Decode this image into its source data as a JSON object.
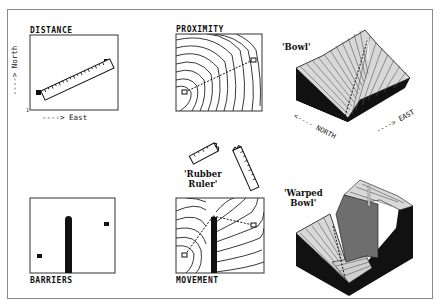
{
  "figure": {
    "panels": {
      "distance": {
        "title": "DISTANCE",
        "x_axis_label": "----> East",
        "y_axis_label": "----> North",
        "origin_tick": "1"
      },
      "proximity": {
        "title": "PROXIMITY"
      },
      "bowl": {
        "label": "'Bowl'",
        "north_label": "<---- NORTH",
        "east_label": "----> EAST"
      },
      "rubber_ruler": {
        "label_line1": "'Rubber",
        "label_line2": "Ruler'"
      },
      "barriers": {
        "title": "BARRIERS"
      },
      "movement": {
        "title": "MOVEMENT"
      },
      "warped_bowl": {
        "label_line1": "'Warped",
        "label_line2": "Bowl'"
      }
    },
    "colors": {
      "ink": "#111111",
      "frame": "#8a8a8a",
      "surface_light": "#d8d8d8",
      "surface_dark": "#111111",
      "barrier_wall": "#6e6e6e"
    }
  }
}
